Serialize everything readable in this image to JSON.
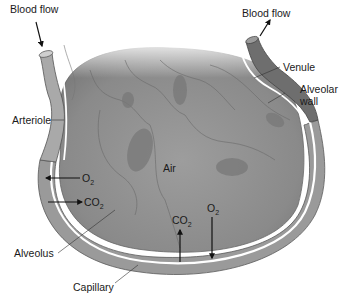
{
  "diagram": {
    "title": "",
    "labels": {
      "blood_flow_in": "Blood flow",
      "blood_flow_out": "Blood flow",
      "venule": "Venule",
      "alveolar_wall_line1": "Alveolar",
      "alveolar_wall_line2": "wall",
      "arteriole": "Arteriole",
      "air": "Air",
      "alveolus": "Alveolus",
      "capillary": "Capillary"
    },
    "gas_exchange": {
      "left_o2": {
        "base": "O",
        "sub": "2",
        "direction": "left (into capillary)"
      },
      "left_co2": {
        "base": "CO",
        "sub": "2",
        "direction": "right (into alveolus)"
      },
      "bottom_co2": {
        "base": "CO",
        "sub": "2",
        "direction": "up (into alveolus)"
      },
      "bottom_o2": {
        "base": "O",
        "sub": "2",
        "direction": "down (into capillary)"
      }
    },
    "colors": {
      "alveolus_fill": "#8e8e8e",
      "alveolus_light": "#a8a8a8",
      "cell_dark": "#777777",
      "capillary_fill": "#9a9a9a",
      "venule_fill": "#6e6e6e",
      "wall_highlight": "#ffffff",
      "outline": "#555555",
      "text": "#1a1a1a"
    }
  }
}
